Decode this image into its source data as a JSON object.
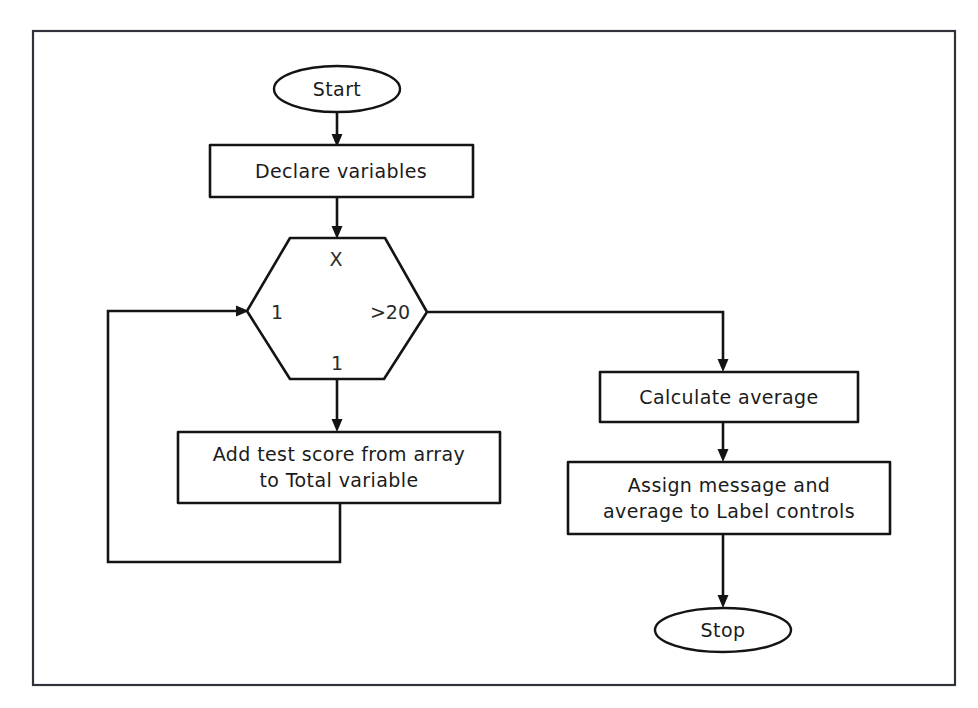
{
  "diagram": {
    "background_color": "#ffffff",
    "line_color": "#141414",
    "frame_color": "#30323a",
    "frame": {
      "x": 33,
      "y": 31,
      "width": 922,
      "height": 654
    },
    "nodes": {
      "start": {
        "label": "Start",
        "shape": "terminator-ellipse"
      },
      "declare": {
        "label": "Declare variables",
        "shape": "process-rectangle"
      },
      "loop": {
        "shape": "preparation-hexagon",
        "top_label": "X",
        "left_label": "1",
        "right_label": ">20",
        "bottom_label": "1"
      },
      "add_score": {
        "line1": "Add test score from array",
        "line2": "to Total variable",
        "shape": "process-rectangle"
      },
      "calc_avg": {
        "label": "Calculate average",
        "shape": "process-rectangle"
      },
      "assign": {
        "line1": "Assign message and",
        "line2": "average to Label controls",
        "shape": "process-rectangle"
      },
      "stop": {
        "label": "Stop",
        "shape": "terminator-ellipse"
      }
    },
    "connectors": [
      {
        "name": "start-to-declare",
        "from": "start",
        "to": "declare",
        "arrow": true
      },
      {
        "name": "declare-to-loop",
        "from": "declare",
        "to": "loop",
        "arrow": true
      },
      {
        "name": "loop-body-to-add-score",
        "from": "loop",
        "to": "add_score",
        "arrow": true
      },
      {
        "name": "add-score-loop-back",
        "from": "add_score",
        "to": "loop",
        "arrow": true
      },
      {
        "name": "loop-exit-to-calc-avg",
        "from": "loop",
        "to": "calc_avg",
        "arrow": true
      },
      {
        "name": "calc-avg-to-assign",
        "from": "calc_avg",
        "to": "assign",
        "arrow": true
      },
      {
        "name": "assign-to-stop",
        "from": "assign",
        "to": "stop",
        "arrow": true
      }
    ]
  }
}
